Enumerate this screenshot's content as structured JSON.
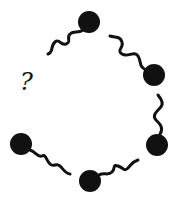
{
  "diagram": {
    "type": "puzzle-sequence",
    "missing_label": "?",
    "colors": {
      "ink": "#111111",
      "background": "#ffffff"
    },
    "pieces": [
      {
        "id": "top",
        "ball": [
          89,
          22
        ],
        "tail_direction": "down-left"
      },
      {
        "id": "upper-right",
        "ball": [
          154,
          75
        ],
        "tail_direction": "up-left"
      },
      {
        "id": "right",
        "ball": [
          157,
          145
        ],
        "tail_direction": "up"
      },
      {
        "id": "bottom",
        "ball": [
          90,
          181
        ],
        "tail_direction": "up-right"
      },
      {
        "id": "left",
        "ball": [
          21,
          144
        ],
        "tail_direction": "down-right"
      }
    ]
  }
}
